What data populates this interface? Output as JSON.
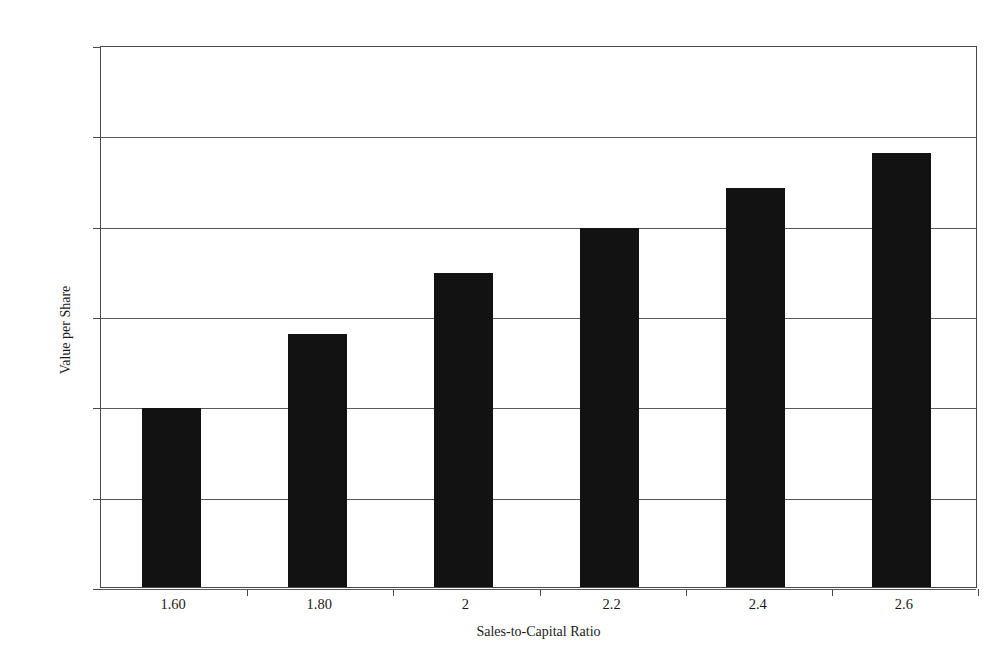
{
  "chart_data": {
    "type": "bar",
    "title": "",
    "xlabel": "Sales-to-Capital Ratio",
    "ylabel": "Value per Share",
    "categories": [
      "1.60",
      "1.80",
      "2",
      "2.2",
      "2.4",
      "2.6"
    ],
    "values": [
      9.9,
      14.0,
      17.4,
      19.85,
      22.1,
      24.0
    ],
    "ylim": [
      0,
      30
    ],
    "ytick_values": [
      0,
      5,
      10,
      15,
      20,
      25,
      30
    ],
    "ytick_labels": [
      "$0.00",
      "$5.00",
      "$10.00",
      "$15.00",
      "$20.00",
      "$25.00",
      "$30.00"
    ],
    "grid": true,
    "grid_axis": "y",
    "legend": "none",
    "series": [
      {
        "name": "Value per Share",
        "values": [
          9.9,
          14.0,
          17.4,
          19.85,
          22.1,
          24.0
        ]
      }
    ],
    "colors": {
      "bar_fill": "#121212",
      "axis": "#4a4a4a",
      "gridline": "#595959",
      "background": "#ffffff",
      "text": "#1a1a1a"
    }
  }
}
